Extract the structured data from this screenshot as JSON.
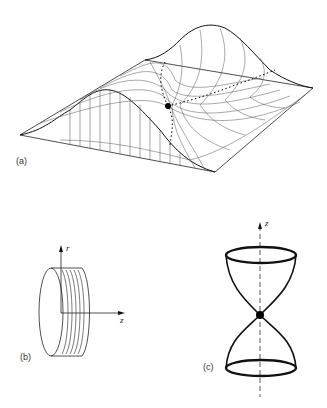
{
  "figure": {
    "panels": [
      {
        "id": "a",
        "label": "(a)",
        "description": "Wireframe surface with two peaks and a saddle point; dotted paths cross at the saddle"
      },
      {
        "id": "b",
        "label": "(b)",
        "description": "Disc/cylinder with r and z axes",
        "axes": {
          "vertical": "r",
          "horizontal": "z"
        }
      },
      {
        "id": "c",
        "label": "(c)",
        "description": "Two cones meeting at a point along the z axis",
        "axes": {
          "vertical": "z"
        }
      }
    ]
  },
  "colors": {
    "line": "#1a1a1a",
    "background": "#ffffff"
  }
}
